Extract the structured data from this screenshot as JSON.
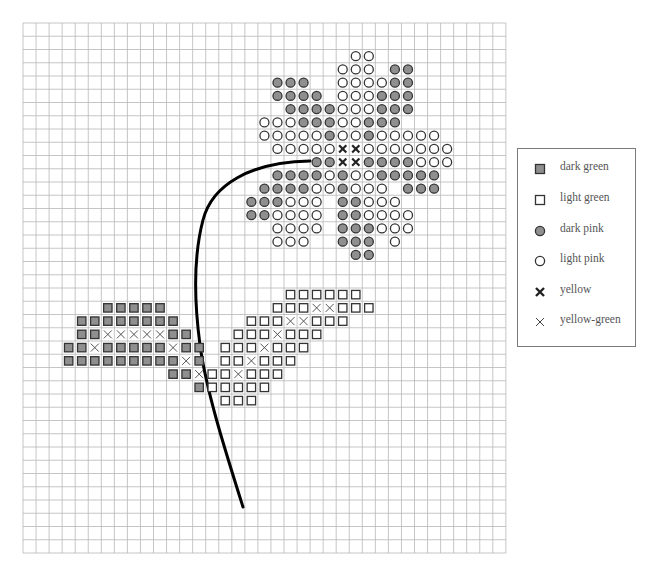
{
  "grid": {
    "cols": 37,
    "rows": 40,
    "origin_x": 23,
    "origin_y": 23,
    "cell_w": 13.05,
    "cell_h": 13.25,
    "line_color": "#b8b8b8"
  },
  "colors": {
    "dark_fill": "#8f8f8f",
    "stroke": "#333333",
    "stem": "#000000"
  },
  "legend": {
    "items": [
      {
        "key": "DG",
        "symbol": "filled-square-icon",
        "label": "dark green"
      },
      {
        "key": "LG",
        "symbol": "open-square-icon",
        "label": "light green"
      },
      {
        "key": "DP",
        "symbol": "filled-circle-icon",
        "label": "dark pink"
      },
      {
        "key": "LP",
        "symbol": "open-circle-icon",
        "label": "light pink"
      },
      {
        "key": "Y",
        "symbol": "bold-x-icon",
        "label": "yellow"
      },
      {
        "key": "YG",
        "symbol": "thin-x-icon",
        "label": "yellow-green"
      }
    ]
  },
  "stem": {
    "path": "M 310 161 C 250 162, 212 185, 203 220 C 193 258, 194 300, 200 345 C 206 390, 225 450, 243 507",
    "width": 3
  },
  "rows": [
    {
      "r": 2,
      "cells": [
        [
          25,
          "LP"
        ],
        [
          26,
          "LP"
        ]
      ]
    },
    {
      "r": 3,
      "cells": [
        [
          24,
          "LP"
        ],
        [
          25,
          "LP"
        ],
        [
          26,
          "LP"
        ],
        [
          28,
          "DP"
        ],
        [
          29,
          "DP"
        ]
      ]
    },
    {
      "r": 4,
      "cells": [
        [
          19,
          "DP"
        ],
        [
          20,
          "DP"
        ],
        [
          21,
          "DP"
        ],
        [
          24,
          "LP"
        ],
        [
          25,
          "LP"
        ],
        [
          26,
          "LP"
        ],
        [
          27,
          "LP"
        ],
        [
          28,
          "DP"
        ],
        [
          29,
          "DP"
        ]
      ]
    },
    {
      "r": 5,
      "cells": [
        [
          19,
          "DP"
        ],
        [
          20,
          "DP"
        ],
        [
          21,
          "DP"
        ],
        [
          22,
          "DP"
        ],
        [
          24,
          "LP"
        ],
        [
          25,
          "LP"
        ],
        [
          26,
          "LP"
        ],
        [
          27,
          "DP"
        ],
        [
          28,
          "DP"
        ],
        [
          29,
          "DP"
        ]
      ]
    },
    {
      "r": 6,
      "cells": [
        [
          20,
          "DP"
        ],
        [
          21,
          "DP"
        ],
        [
          22,
          "DP"
        ],
        [
          23,
          "DP"
        ],
        [
          24,
          "LP"
        ],
        [
          25,
          "LP"
        ],
        [
          26,
          "LP"
        ],
        [
          27,
          "DP"
        ],
        [
          28,
          "DP"
        ],
        [
          29,
          "DP"
        ]
      ]
    },
    {
      "r": 7,
      "cells": [
        [
          18,
          "LP"
        ],
        [
          19,
          "LP"
        ],
        [
          20,
          "LP"
        ],
        [
          21,
          "DP"
        ],
        [
          22,
          "DP"
        ],
        [
          23,
          "DP"
        ],
        [
          24,
          "LP"
        ],
        [
          25,
          "LP"
        ],
        [
          26,
          "DP"
        ],
        [
          27,
          "DP"
        ],
        [
          28,
          "DP"
        ]
      ]
    },
    {
      "r": 8,
      "cells": [
        [
          18,
          "LP"
        ],
        [
          19,
          "LP"
        ],
        [
          20,
          "LP"
        ],
        [
          21,
          "LP"
        ],
        [
          22,
          "LP"
        ],
        [
          23,
          "DP"
        ],
        [
          24,
          "LP"
        ],
        [
          25,
          "LP"
        ],
        [
          26,
          "DP"
        ],
        [
          27,
          "LP"
        ],
        [
          28,
          "LP"
        ],
        [
          29,
          "LP"
        ],
        [
          30,
          "LP"
        ],
        [
          31,
          "LP"
        ]
      ]
    },
    {
      "r": 9,
      "cells": [
        [
          19,
          "LP"
        ],
        [
          20,
          "LP"
        ],
        [
          21,
          "LP"
        ],
        [
          22,
          "LP"
        ],
        [
          23,
          "LP"
        ],
        [
          24,
          "Y"
        ],
        [
          25,
          "Y"
        ],
        [
          26,
          "LP"
        ],
        [
          27,
          "LP"
        ],
        [
          28,
          "LP"
        ],
        [
          29,
          "LP"
        ],
        [
          30,
          "LP"
        ],
        [
          31,
          "LP"
        ],
        [
          32,
          "LP"
        ]
      ]
    },
    {
      "r": 10,
      "cells": [
        [
          22,
          "DP"
        ],
        [
          23,
          "DP"
        ],
        [
          24,
          "Y"
        ],
        [
          25,
          "Y"
        ],
        [
          26,
          "DP"
        ],
        [
          27,
          "DP"
        ],
        [
          28,
          "DP"
        ],
        [
          29,
          "DP"
        ],
        [
          30,
          "LP"
        ],
        [
          31,
          "LP"
        ],
        [
          32,
          "LP"
        ]
      ]
    },
    {
      "r": 11,
      "cells": [
        [
          19,
          "DP"
        ],
        [
          20,
          "DP"
        ],
        [
          21,
          "DP"
        ],
        [
          22,
          "DP"
        ],
        [
          23,
          "LP"
        ],
        [
          24,
          "DP"
        ],
        [
          25,
          "LP"
        ],
        [
          26,
          "LP"
        ],
        [
          27,
          "DP"
        ],
        [
          28,
          "DP"
        ],
        [
          29,
          "DP"
        ],
        [
          30,
          "DP"
        ],
        [
          31,
          "DP"
        ]
      ]
    },
    {
      "r": 12,
      "cells": [
        [
          18,
          "DP"
        ],
        [
          19,
          "DP"
        ],
        [
          20,
          "DP"
        ],
        [
          21,
          "DP"
        ],
        [
          22,
          "LP"
        ],
        [
          23,
          "LP"
        ],
        [
          24,
          "DP"
        ],
        [
          25,
          "LP"
        ],
        [
          26,
          "LP"
        ],
        [
          27,
          "LP"
        ],
        [
          29,
          "DP"
        ],
        [
          30,
          "DP"
        ],
        [
          31,
          "DP"
        ]
      ]
    },
    {
      "r": 13,
      "cells": [
        [
          17,
          "DP"
        ],
        [
          18,
          "DP"
        ],
        [
          19,
          "DP"
        ],
        [
          20,
          "LP"
        ],
        [
          21,
          "LP"
        ],
        [
          22,
          "LP"
        ],
        [
          24,
          "DP"
        ],
        [
          25,
          "DP"
        ],
        [
          26,
          "LP"
        ],
        [
          27,
          "LP"
        ],
        [
          28,
          "LP"
        ]
      ]
    },
    {
      "r": 14,
      "cells": [
        [
          17,
          "DP"
        ],
        [
          18,
          "DP"
        ],
        [
          19,
          "LP"
        ],
        [
          20,
          "LP"
        ],
        [
          21,
          "LP"
        ],
        [
          22,
          "LP"
        ],
        [
          24,
          "DP"
        ],
        [
          25,
          "DP"
        ],
        [
          26,
          "LP"
        ],
        [
          27,
          "LP"
        ],
        [
          28,
          "LP"
        ],
        [
          29,
          "LP"
        ]
      ]
    },
    {
      "r": 15,
      "cells": [
        [
          19,
          "LP"
        ],
        [
          20,
          "LP"
        ],
        [
          21,
          "LP"
        ],
        [
          22,
          "LP"
        ],
        [
          24,
          "DP"
        ],
        [
          25,
          "DP"
        ],
        [
          26,
          "DP"
        ],
        [
          27,
          "LP"
        ],
        [
          28,
          "LP"
        ],
        [
          29,
          "LP"
        ]
      ]
    },
    {
      "r": 16,
      "cells": [
        [
          19,
          "LP"
        ],
        [
          20,
          "LP"
        ],
        [
          21,
          "LP"
        ],
        [
          24,
          "DP"
        ],
        [
          25,
          "DP"
        ],
        [
          26,
          "DP"
        ],
        [
          28,
          "LP"
        ]
      ]
    },
    {
      "r": 17,
      "cells": [
        [
          25,
          "DP"
        ],
        [
          26,
          "DP"
        ]
      ]
    },
    {
      "r": 20,
      "cells": [
        [
          20,
          "LG"
        ],
        [
          21,
          "LG"
        ],
        [
          22,
          "LG"
        ],
        [
          23,
          "LG"
        ],
        [
          24,
          "LG"
        ],
        [
          25,
          "LG"
        ]
      ]
    },
    {
      "r": 21,
      "cells": [
        [
          6,
          "DG"
        ],
        [
          7,
          "DG"
        ],
        [
          8,
          "DG"
        ],
        [
          9,
          "DG"
        ],
        [
          10,
          "DG"
        ],
        [
          19,
          "LG"
        ],
        [
          20,
          "LG"
        ],
        [
          21,
          "LG"
        ],
        [
          22,
          "YG"
        ],
        [
          23,
          "YG"
        ],
        [
          24,
          "LG"
        ],
        [
          25,
          "LG"
        ],
        [
          26,
          "LG"
        ]
      ]
    },
    {
      "r": 22,
      "cells": [
        [
          4,
          "DG"
        ],
        [
          5,
          "DG"
        ],
        [
          6,
          "DG"
        ],
        [
          7,
          "DG"
        ],
        [
          8,
          "DG"
        ],
        [
          9,
          "DG"
        ],
        [
          10,
          "DG"
        ],
        [
          11,
          "DG"
        ],
        [
          17,
          "LG"
        ],
        [
          18,
          "LG"
        ],
        [
          19,
          "LG"
        ],
        [
          20,
          "YG"
        ],
        [
          21,
          "YG"
        ],
        [
          22,
          "LG"
        ],
        [
          23,
          "LG"
        ],
        [
          24,
          "LG"
        ]
      ]
    },
    {
      "r": 23,
      "cells": [
        [
          4,
          "DG"
        ],
        [
          5,
          "DG"
        ],
        [
          6,
          "YG"
        ],
        [
          7,
          "YG"
        ],
        [
          8,
          "YG"
        ],
        [
          9,
          "YG"
        ],
        [
          10,
          "YG"
        ],
        [
          11,
          "DG"
        ],
        [
          12,
          "DG"
        ],
        [
          16,
          "LG"
        ],
        [
          17,
          "LG"
        ],
        [
          18,
          "LG"
        ],
        [
          19,
          "YG"
        ],
        [
          20,
          "LG"
        ],
        [
          21,
          "LG"
        ],
        [
          22,
          "LG"
        ]
      ]
    },
    {
      "r": 24,
      "cells": [
        [
          3,
          "DG"
        ],
        [
          4,
          "DG"
        ],
        [
          5,
          "YG"
        ],
        [
          6,
          "DG"
        ],
        [
          7,
          "DG"
        ],
        [
          8,
          "DG"
        ],
        [
          9,
          "DG"
        ],
        [
          10,
          "DG"
        ],
        [
          11,
          "YG"
        ],
        [
          12,
          "DG"
        ],
        [
          13,
          "DG"
        ],
        [
          15,
          "LG"
        ],
        [
          16,
          "LG"
        ],
        [
          17,
          "LG"
        ],
        [
          18,
          "YG"
        ],
        [
          19,
          "LG"
        ],
        [
          20,
          "LG"
        ],
        [
          21,
          "LG"
        ]
      ]
    },
    {
      "r": 25,
      "cells": [
        [
          3,
          "DG"
        ],
        [
          4,
          "DG"
        ],
        [
          5,
          "DG"
        ],
        [
          6,
          "DG"
        ],
        [
          7,
          "DG"
        ],
        [
          8,
          "DG"
        ],
        [
          9,
          "DG"
        ],
        [
          10,
          "DG"
        ],
        [
          11,
          "DG"
        ],
        [
          12,
          "YG"
        ],
        [
          13,
          "DG"
        ],
        [
          15,
          "LG"
        ],
        [
          16,
          "LG"
        ],
        [
          17,
          "YG"
        ],
        [
          18,
          "LG"
        ],
        [
          19,
          "LG"
        ],
        [
          20,
          "LG"
        ]
      ]
    },
    {
      "r": 26,
      "cells": [
        [
          11,
          "DG"
        ],
        [
          12,
          "DG"
        ],
        [
          13,
          "YG"
        ],
        [
          14,
          "LG"
        ],
        [
          15,
          "LG"
        ],
        [
          16,
          "YG"
        ],
        [
          17,
          "LG"
        ],
        [
          18,
          "LG"
        ],
        [
          19,
          "LG"
        ]
      ]
    },
    {
      "r": 27,
      "cells": [
        [
          13,
          "DG"
        ],
        [
          14,
          "LG"
        ],
        [
          15,
          "LG"
        ],
        [
          16,
          "LG"
        ],
        [
          17,
          "LG"
        ],
        [
          18,
          "LG"
        ]
      ]
    },
    {
      "r": 28,
      "cells": [
        [
          15,
          "LG"
        ],
        [
          16,
          "LG"
        ],
        [
          17,
          "LG"
        ]
      ]
    }
  ]
}
